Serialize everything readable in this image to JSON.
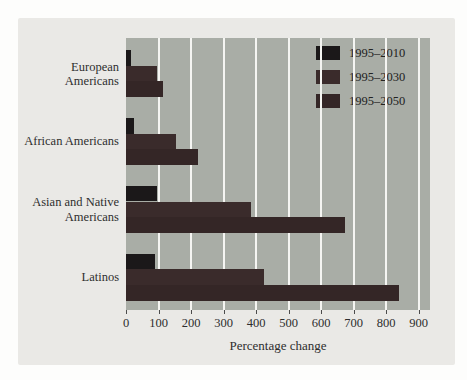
{
  "figure": {
    "background_color": "#fdfdfc",
    "panel_color": "#eae9e6",
    "plot_background_color": "#a9ada6",
    "gridline_color": "#f5f5f2",
    "text_color": "#2e2e2e"
  },
  "chart_data": {
    "type": "bar",
    "orientation": "horizontal",
    "title": "",
    "xlabel": "Percentage change",
    "ylabel": "",
    "categories": [
      "European Americans",
      "African Americans",
      "Asian and Native Americans",
      "Latinos"
    ],
    "series": [
      {
        "name": "1995–2010",
        "color": "#1b1819",
        "values": [
          15,
          25,
          95,
          90
        ]
      },
      {
        "name": "1995–2030",
        "color": "#3a2b2b",
        "values": [
          95,
          155,
          385,
          425
        ]
      },
      {
        "name": "1995–2050",
        "color": "#342626",
        "values": [
          115,
          220,
          675,
          840
        ]
      }
    ],
    "x_ticks": [
      0,
      100,
      200,
      300,
      400,
      500,
      600,
      700,
      800,
      900
    ],
    "xlim": [
      0,
      935
    ],
    "grid": "vertical-white-lines",
    "legend_position": "top-right",
    "legend_entries": [
      "1995–2010",
      "1995–2030",
      "1995–2050"
    ]
  }
}
